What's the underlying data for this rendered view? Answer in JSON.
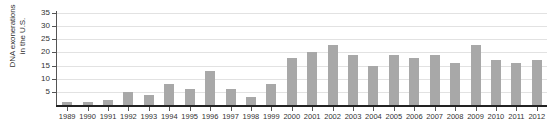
{
  "chart_data": {
    "type": "bar",
    "title": "",
    "xlabel": "",
    "ylabel": "DNA exonerations in the U.S.",
    "ylabel_lines": [
      "DNA exonerations",
      "in the U.S."
    ],
    "categories": [
      "1989",
      "1990",
      "1991",
      "1992",
      "1993",
      "1994",
      "1995",
      "1996",
      "1997",
      "1998",
      "1999",
      "2000",
      "2001",
      "2002",
      "2003",
      "2004",
      "2005",
      "2006",
      "2007",
      "2008",
      "2009",
      "2010",
      "2011",
      "2012"
    ],
    "values": [
      1,
      1,
      2,
      5,
      4,
      8,
      6,
      13,
      6,
      3,
      8,
      18,
      20,
      23,
      19,
      15,
      19,
      18,
      19,
      16,
      23,
      17,
      16,
      17
    ],
    "ylim": [
      0,
      35
    ],
    "yticks": [
      5,
      10,
      15,
      20,
      25,
      30,
      35
    ],
    "ytick_labels": [
      "5",
      "10",
      "15",
      "20",
      "25",
      "30",
      "35"
    ],
    "grid": true,
    "legend": "none",
    "bar_color": "#a8a8a8",
    "grid_color": "#e2e2e2",
    "axis_color": "#222222",
    "text_color": "#333333"
  }
}
